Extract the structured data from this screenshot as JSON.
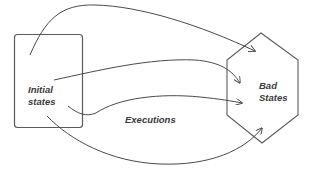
{
  "diagram": {
    "title": "",
    "colors": {
      "stroke": "#4a4a4a",
      "text": "#3a3a3a",
      "background": "#ffffff"
    },
    "nodes": [
      {
        "id": "initial",
        "shape": "rounded-rectangle",
        "label_line1": "Initial",
        "label_line2": "states"
      },
      {
        "id": "bad",
        "shape": "hexagon",
        "label_line1": "Bad",
        "label_line2": "States"
      }
    ],
    "edge_label": "Executions",
    "edges": [
      {
        "from": "initial",
        "to": "bad",
        "style": "arc-over-top"
      },
      {
        "from": "initial",
        "to": "bad",
        "style": "straight-curve"
      },
      {
        "from": "initial",
        "to": "bad",
        "style": "s-curve"
      },
      {
        "from": "initial",
        "to": "bad",
        "style": "arc-under-bottom"
      }
    ]
  }
}
